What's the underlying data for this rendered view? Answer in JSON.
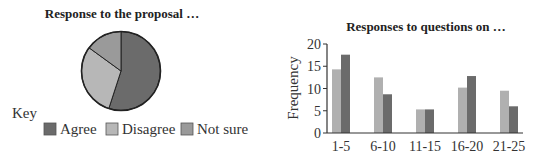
{
  "chart_data": [
    {
      "type": "pie",
      "title": "Response to the proposal …",
      "legend_title": "Key",
      "legend_position": "bottom",
      "slices": [
        {
          "label": "Agree",
          "value": 55,
          "color": "#6b6b6b"
        },
        {
          "label": "Disagree",
          "value": 30,
          "color": "#b7b7b7"
        },
        {
          "label": "Not sure",
          "value": 15,
          "color": "#9a9a9a"
        }
      ]
    },
    {
      "type": "bar",
      "title": "Responses to questions on …",
      "xlabel": "",
      "ylabel": "Frequency",
      "ylim": [
        0,
        20
      ],
      "yticks": [
        0,
        5,
        10,
        15,
        20
      ],
      "grid": false,
      "categories": [
        "1-5",
        "6-10",
        "11-15",
        "16-20",
        "21-25"
      ],
      "series": [
        {
          "name": "Series A (light)",
          "color": "#b0b0b0",
          "values": [
            14.3,
            12.5,
            5.3,
            10.2,
            9.5
          ]
        },
        {
          "name": "Series B (dark)",
          "color": "#6b6b6b",
          "values": [
            17.6,
            8.7,
            5.3,
            12.8,
            6
          ]
        }
      ]
    }
  ]
}
